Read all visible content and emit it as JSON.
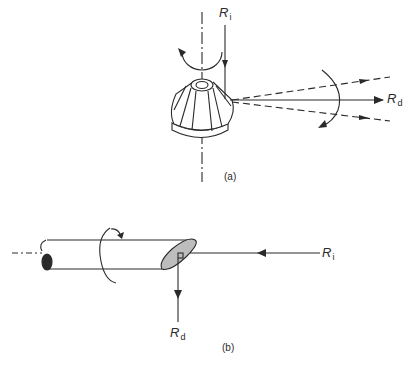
{
  "figure": {
    "panel_a": {
      "caption": "(a)",
      "incident_label": {
        "symbol": "R",
        "subscript": "i"
      },
      "diffracted_label": {
        "symbol": "R",
        "subscript": "d"
      },
      "description": "Rotating conical cutter on vertical axis; incident ray Ri enters from above, diffracted rays Rd spread horizontally with rotation arcs"
    },
    "panel_b": {
      "caption": "(b)",
      "incident_label": {
        "symbol": "R",
        "subscript": "i"
      },
      "diffracted_label": {
        "symbol": "R",
        "subscript": "d"
      },
      "description": "Horizontal cylinder with slanted shaded end face; incident ray Ri enters from right, diffracted ray Rd exits downward; rotation arrow around cylinder axis"
    },
    "colors": {
      "line": "#2a2a2a",
      "shade": "#bdbdbd",
      "background": "#ffffff"
    }
  }
}
